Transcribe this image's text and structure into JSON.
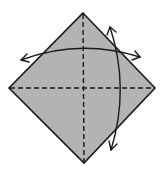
{
  "diagram": {
    "type": "origami-fold-diagram",
    "paper": {
      "shape": "square-rotated-45",
      "fill": "#b3b3b3",
      "stroke": "#1a1a1a",
      "vertices": {
        "top": [
          83,
          13
        ],
        "right": [
          155,
          88
        ],
        "bottom": [
          84,
          163
        ],
        "left": [
          9,
          88
        ]
      }
    },
    "creases": [
      {
        "name": "vertical-valley-fold",
        "style": "dashed",
        "from": [
          83,
          13
        ],
        "to": [
          84,
          163
        ]
      },
      {
        "name": "horizontal-valley-fold",
        "style": "dashed",
        "from": [
          9,
          88
        ],
        "to": [
          155,
          88
        ]
      }
    ],
    "arrows": [
      {
        "name": "horizontal-fold-arrow",
        "style": "curved-double-headed",
        "from": [
          20,
          59
        ],
        "to": [
          141,
          59
        ]
      },
      {
        "name": "vertical-fold-arrow",
        "style": "curved-double-headed",
        "from": [
          111,
          27
        ],
        "to": [
          111,
          150
        ]
      }
    ]
  }
}
